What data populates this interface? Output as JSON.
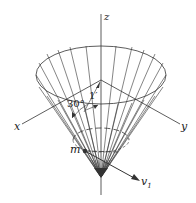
{
  "figure": {
    "type": "cone-particle-diagram",
    "labels": {
      "z_axis": "z",
      "x_axis": "x",
      "y_axis": "y",
      "angle": "30°",
      "length": "1′",
      "mass": "m",
      "velocity": "v",
      "velocity_subscript": "1"
    },
    "colors": {
      "line": "#333333",
      "background": "#ffffff"
    }
  }
}
